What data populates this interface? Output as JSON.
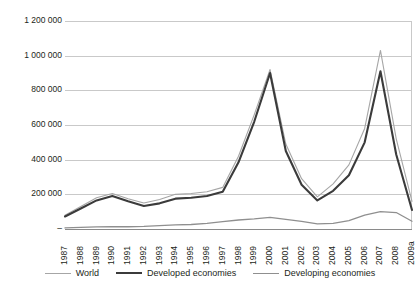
{
  "chart_data": {
    "type": "line",
    "title": "",
    "subtitle": "",
    "xlabel": "",
    "ylabel": "",
    "grid": true,
    "legend_position": "bottom",
    "ylim": [
      0,
      1200000
    ],
    "ytick_labels": [
      "1 200 000",
      "1 000 000",
      "800 000",
      "600 000",
      "400 000",
      "200 000",
      "–"
    ],
    "ytick_values": [
      1200000,
      1000000,
      800000,
      600000,
      400000,
      200000,
      0
    ],
    "categories": [
      "1987",
      "1988",
      "1989",
      "1990",
      "1991",
      "1992",
      "1993",
      "1994",
      "1995",
      "1996",
      "1997",
      "1998",
      "1999",
      "2000",
      "2001",
      "2002",
      "2003",
      "2004",
      "2005",
      "2006",
      "2007",
      "2008",
      "2009a"
    ],
    "series": [
      {
        "name": "World",
        "color": "#a6a6a6",
        "width": 1.1,
        "values": [
          80000,
          130000,
          180000,
          205000,
          175000,
          150000,
          170000,
          200000,
          205000,
          215000,
          240000,
          420000,
          660000,
          920000,
          490000,
          290000,
          185000,
          260000,
          370000,
          580000,
          1030000,
          520000,
          160000
        ]
      },
      {
        "name": "Developed economies",
        "color": "#3b3b3b",
        "width": 2.1,
        "values": [
          72000,
          118000,
          165000,
          190000,
          160000,
          133000,
          148000,
          175000,
          180000,
          190000,
          215000,
          385000,
          620000,
          900000,
          450000,
          255000,
          165000,
          220000,
          310000,
          500000,
          910000,
          430000,
          110000
        ]
      },
      {
        "name": "Developing economies",
        "color": "#8f8f8f",
        "width": 1.3,
        "values": [
          6000,
          9000,
          12000,
          13000,
          13000,
          15000,
          20000,
          24000,
          26000,
          32000,
          42000,
          52000,
          58000,
          67000,
          55000,
          44000,
          30000,
          32000,
          48000,
          80000,
          100000,
          95000,
          45000
        ]
      }
    ]
  },
  "legend": {
    "items": [
      {
        "label": "World"
      },
      {
        "label": "Developed economies"
      },
      {
        "label": "Developing economies"
      }
    ]
  }
}
